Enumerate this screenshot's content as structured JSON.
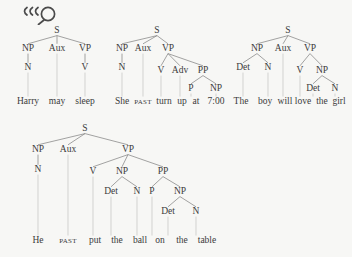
{
  "page": {
    "background_color": "#f7f7f5",
    "ink_color": "#3b3b3b",
    "branch_color": "#7d7d7d",
    "leader_color": "#c2c2c2"
  },
  "toolbar": {
    "zoom_icon_name": "magnifier-icon",
    "zoom_icon_glyph": "magnifying-glass-with-motion-lines"
  },
  "labels": {
    "S": "S",
    "NP": "NP",
    "VP": "VP",
    "PP": "PP",
    "Aux": "Aux",
    "N": "N",
    "V": "V",
    "P": "P",
    "Det": "Det",
    "Adv": "Adv"
  },
  "trees": [
    {
      "id": "tree-harry-may-sleep",
      "sentence": "Harry may sleep",
      "root": "S",
      "nodes": [
        {
          "id": "t1-s",
          "label": "S",
          "x": 57,
          "y": 33,
          "kind": "phrase"
        },
        {
          "id": "t1-np",
          "label": "NP",
          "x": 28,
          "y": 51,
          "kind": "phrase"
        },
        {
          "id": "t1-aux",
          "label": "Aux",
          "x": 57,
          "y": 51,
          "kind": "phrase"
        },
        {
          "id": "t1-vp",
          "label": "VP",
          "x": 85,
          "y": 51,
          "kind": "phrase"
        },
        {
          "id": "t1-n",
          "label": "N",
          "x": 28,
          "y": 70,
          "kind": "preterminal"
        },
        {
          "id": "t1-v",
          "label": "V",
          "x": 85,
          "y": 70,
          "kind": "preterminal"
        }
      ],
      "branches": [
        {
          "from": "t1-s",
          "to": "t1-np"
        },
        {
          "from": "t1-s",
          "to": "t1-aux"
        },
        {
          "from": "t1-s",
          "to": "t1-vp"
        },
        {
          "from": "t1-np",
          "to": "t1-n"
        },
        {
          "from": "t1-vp",
          "to": "t1-v"
        }
      ],
      "terminals": [
        {
          "id": "t1-w1",
          "text": "Harry",
          "x": 28,
          "y": 104,
          "parent": "t1-n",
          "smallcaps": false
        },
        {
          "id": "t1-w2",
          "text": "may",
          "x": 57,
          "y": 104,
          "parent": "t1-aux",
          "smallcaps": false
        },
        {
          "id": "t1-w3",
          "text": "sleep",
          "x": 85,
          "y": 104,
          "parent": "t1-v",
          "smallcaps": false
        }
      ]
    },
    {
      "id": "tree-she-past-turn-up-at-seven",
      "sentence": "She PAST turn up at 7:00",
      "root": "S",
      "nodes": [
        {
          "id": "t2-s",
          "label": "S",
          "x": 157,
          "y": 33,
          "kind": "phrase"
        },
        {
          "id": "t2-np",
          "label": "NP",
          "x": 122,
          "y": 51,
          "kind": "phrase"
        },
        {
          "id": "t2-aux",
          "label": "Aux",
          "x": 143,
          "y": 51,
          "kind": "phrase"
        },
        {
          "id": "t2-vp",
          "label": "VP",
          "x": 168,
          "y": 51,
          "kind": "phrase"
        },
        {
          "id": "t2-n",
          "label": "N",
          "x": 122,
          "y": 70,
          "kind": "preterminal"
        },
        {
          "id": "t2-v",
          "label": "V",
          "x": 161,
          "y": 73,
          "kind": "preterminal"
        },
        {
          "id": "t2-adv",
          "label": "Adv",
          "x": 180,
          "y": 73,
          "kind": "preterminal"
        },
        {
          "id": "t2-pp",
          "label": "PP",
          "x": 203,
          "y": 73,
          "kind": "phrase"
        },
        {
          "id": "t2-p",
          "label": "P",
          "x": 191,
          "y": 91,
          "kind": "preterminal"
        },
        {
          "id": "t2-np2",
          "label": "NP",
          "x": 216,
          "y": 91,
          "kind": "phrase"
        }
      ],
      "branches": [
        {
          "from": "t2-s",
          "to": "t2-np"
        },
        {
          "from": "t2-s",
          "to": "t2-aux"
        },
        {
          "from": "t2-s",
          "to": "t2-vp"
        },
        {
          "from": "t2-np",
          "to": "t2-n"
        },
        {
          "from": "t2-vp",
          "to": "t2-v"
        },
        {
          "from": "t2-vp",
          "to": "t2-adv"
        },
        {
          "from": "t2-vp",
          "to": "t2-pp"
        },
        {
          "from": "t2-pp",
          "to": "t2-p"
        },
        {
          "from": "t2-pp",
          "to": "t2-np2"
        }
      ],
      "terminals": [
        {
          "id": "t2-w1",
          "text": "She",
          "x": 122,
          "y": 104,
          "parent": "t2-n",
          "smallcaps": false
        },
        {
          "id": "t2-w2",
          "text": "PAST",
          "x": 143,
          "y": 104,
          "parent": "t2-aux",
          "smallcaps": true
        },
        {
          "id": "t2-w3",
          "text": "turn",
          "x": 164,
          "y": 104,
          "parent": "t2-v",
          "smallcaps": false
        },
        {
          "id": "t2-w4",
          "text": "up",
          "x": 182,
          "y": 104,
          "parent": "t2-adv",
          "smallcaps": false
        },
        {
          "id": "t2-w5",
          "text": "at",
          "x": 196,
          "y": 104,
          "parent": "t2-p",
          "smallcaps": false
        },
        {
          "id": "t2-w6",
          "text": "7:00",
          "x": 216,
          "y": 104,
          "parent": "t2-np2",
          "smallcaps": false
        }
      ]
    },
    {
      "id": "tree-the-boy-will-love-the-girl",
      "sentence": "The boy will love the girl",
      "root": "S",
      "nodes": [
        {
          "id": "t3-s",
          "label": "S",
          "x": 288,
          "y": 33,
          "kind": "phrase"
        },
        {
          "id": "t3-np",
          "label": "NP",
          "x": 257,
          "y": 51,
          "kind": "phrase"
        },
        {
          "id": "t3-aux",
          "label": "Aux",
          "x": 283,
          "y": 51,
          "kind": "phrase"
        },
        {
          "id": "t3-vp",
          "label": "VP",
          "x": 310,
          "y": 51,
          "kind": "phrase"
        },
        {
          "id": "t3-det1",
          "label": "Det",
          "x": 243,
          "y": 70,
          "kind": "preterminal"
        },
        {
          "id": "t3-n1",
          "label": "N",
          "x": 268,
          "y": 70,
          "kind": "preterminal"
        },
        {
          "id": "t3-v",
          "label": "V",
          "x": 300,
          "y": 73,
          "kind": "preterminal"
        },
        {
          "id": "t3-np2",
          "label": "NP",
          "x": 322,
          "y": 73,
          "kind": "phrase"
        },
        {
          "id": "t3-det2",
          "label": "Det",
          "x": 313,
          "y": 91,
          "kind": "preterminal"
        },
        {
          "id": "t3-n2",
          "label": "N",
          "x": 335,
          "y": 91,
          "kind": "preterminal"
        }
      ],
      "branches": [
        {
          "from": "t3-s",
          "to": "t3-np"
        },
        {
          "from": "t3-s",
          "to": "t3-aux"
        },
        {
          "from": "t3-s",
          "to": "t3-vp"
        },
        {
          "from": "t3-np",
          "to": "t3-det1"
        },
        {
          "from": "t3-np",
          "to": "t3-n1"
        },
        {
          "from": "t3-vp",
          "to": "t3-v"
        },
        {
          "from": "t3-vp",
          "to": "t3-np2"
        },
        {
          "from": "t3-np2",
          "to": "t3-det2"
        },
        {
          "from": "t3-np2",
          "to": "t3-n2"
        }
      ],
      "terminals": [
        {
          "id": "t3-w1",
          "text": "The",
          "x": 241,
          "y": 104,
          "parent": "t3-det1",
          "smallcaps": false
        },
        {
          "id": "t3-w2",
          "text": "boy",
          "x": 265,
          "y": 104,
          "parent": "t3-n1",
          "smallcaps": false
        },
        {
          "id": "t3-w3",
          "text": "will",
          "x": 285,
          "y": 104,
          "parent": "t3-aux",
          "smallcaps": false
        },
        {
          "id": "t3-w4",
          "text": "love",
          "x": 303,
          "y": 104,
          "parent": "t3-v",
          "smallcaps": false
        },
        {
          "id": "t3-w5",
          "text": "the",
          "x": 322,
          "y": 104,
          "parent": "t3-det2",
          "smallcaps": false
        },
        {
          "id": "t3-w6",
          "text": "girl",
          "x": 339,
          "y": 104,
          "parent": "t3-n2",
          "smallcaps": false
        }
      ]
    },
    {
      "id": "tree-he-past-put-the-ball-on-the-table",
      "sentence": "He PAST put the ball on the table",
      "root": "S",
      "nodes": [
        {
          "id": "t4-s",
          "label": "S",
          "x": 85,
          "y": 131,
          "kind": "phrase"
        },
        {
          "id": "t4-np",
          "label": "NP",
          "x": 38,
          "y": 152,
          "kind": "phrase"
        },
        {
          "id": "t4-aux",
          "label": "Aux",
          "x": 68,
          "y": 152,
          "kind": "phrase"
        },
        {
          "id": "t4-vp",
          "label": "VP",
          "x": 128,
          "y": 152,
          "kind": "phrase"
        },
        {
          "id": "t4-n",
          "label": "N",
          "x": 38,
          "y": 172,
          "kind": "preterminal"
        },
        {
          "id": "t4-v",
          "label": "V",
          "x": 93,
          "y": 174,
          "kind": "preterminal"
        },
        {
          "id": "t4-np2",
          "label": "NP",
          "x": 122,
          "y": 174,
          "kind": "phrase"
        },
        {
          "id": "t4-pp",
          "label": "PP",
          "x": 163,
          "y": 174,
          "kind": "phrase"
        },
        {
          "id": "t4-det1",
          "label": "Det",
          "x": 111,
          "y": 194,
          "kind": "preterminal"
        },
        {
          "id": "t4-n2",
          "label": "N",
          "x": 137,
          "y": 194,
          "kind": "preterminal"
        },
        {
          "id": "t4-p",
          "label": "P",
          "x": 152,
          "y": 194,
          "kind": "preterminal"
        },
        {
          "id": "t4-np3",
          "label": "NP",
          "x": 180,
          "y": 194,
          "kind": "phrase"
        },
        {
          "id": "t4-det2",
          "label": "Det",
          "x": 168,
          "y": 214,
          "kind": "preterminal"
        },
        {
          "id": "t4-n3",
          "label": "N",
          "x": 196,
          "y": 214,
          "kind": "preterminal"
        }
      ],
      "branches": [
        {
          "from": "t4-s",
          "to": "t4-np"
        },
        {
          "from": "t4-s",
          "to": "t4-aux"
        },
        {
          "from": "t4-s",
          "to": "t4-vp"
        },
        {
          "from": "t4-np",
          "to": "t4-n"
        },
        {
          "from": "t4-vp",
          "to": "t4-v"
        },
        {
          "from": "t4-vp",
          "to": "t4-np2"
        },
        {
          "from": "t4-vp",
          "to": "t4-pp"
        },
        {
          "from": "t4-np2",
          "to": "t4-det1"
        },
        {
          "from": "t4-np2",
          "to": "t4-n2"
        },
        {
          "from": "t4-pp",
          "to": "t4-p"
        },
        {
          "from": "t4-pp",
          "to": "t4-np3"
        },
        {
          "from": "t4-np3",
          "to": "t4-det2"
        },
        {
          "from": "t4-np3",
          "to": "t4-n3"
        }
      ],
      "terminals": [
        {
          "id": "t4-w1",
          "text": "He",
          "x": 38,
          "y": 243,
          "parent": "t4-n",
          "smallcaps": false
        },
        {
          "id": "t4-w2",
          "text": "PAST",
          "x": 68,
          "y": 243,
          "parent": "t4-aux",
          "smallcaps": true
        },
        {
          "id": "t4-w3",
          "text": "put",
          "x": 95,
          "y": 243,
          "parent": "t4-v",
          "smallcaps": false
        },
        {
          "id": "t4-w4",
          "text": "the",
          "x": 117,
          "y": 243,
          "parent": "t4-det1",
          "smallcaps": false
        },
        {
          "id": "t4-w5",
          "text": "ball",
          "x": 140,
          "y": 243,
          "parent": "t4-n2",
          "smallcaps": false
        },
        {
          "id": "t4-w6",
          "text": "on",
          "x": 160,
          "y": 243,
          "parent": "t4-p",
          "smallcaps": false
        },
        {
          "id": "t4-w7",
          "text": "the",
          "x": 182,
          "y": 243,
          "parent": "t4-det2",
          "smallcaps": false
        },
        {
          "id": "t4-w8",
          "text": "table",
          "x": 207,
          "y": 243,
          "parent": "t4-n3",
          "smallcaps": false
        }
      ]
    }
  ]
}
